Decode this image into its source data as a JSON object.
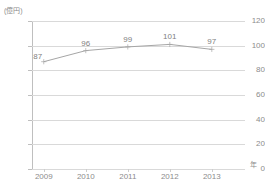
{
  "chart_data": {
    "type": "line",
    "title": "",
    "categories": [
      "2009",
      "2010",
      "2011",
      "2012",
      "2013"
    ],
    "values": [
      87,
      96,
      99,
      101,
      97
    ],
    "series": [
      {
        "name": "",
        "values": [
          87,
          96,
          99,
          101,
          97
        ]
      }
    ],
    "data_labels": [
      "87",
      "96",
      "99",
      "101",
      "97"
    ],
    "xlabel": "年",
    "ylabel": "(億円)",
    "ylim": [
      0,
      120
    ],
    "ytick_labels": [
      "0",
      "20",
      "40",
      "60",
      "80",
      "100",
      "120"
    ],
    "ytick_values": [
      0,
      20,
      40,
      60,
      80,
      100,
      120
    ],
    "xtick_labels": [
      "2009",
      "2010",
      "2011",
      "2012",
      "2013"
    ],
    "grid": "horizontal",
    "legend": "none",
    "colors": {
      "line": "#a6a6a6",
      "marker": "#a6a6a6",
      "gridline": "#d9d9d9",
      "axis": "#bfbfbf",
      "text": "#808080",
      "background": "#ffffff"
    }
  }
}
